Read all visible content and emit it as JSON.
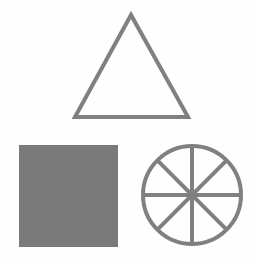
{
  "canvas": {
    "width": 256,
    "height": 265,
    "background": "#fefefe"
  },
  "colors": {
    "stroke": "#808080",
    "fill": "#7a7a7a"
  },
  "shapes": [
    {
      "type": "triangle",
      "points": [
        [
          131,
          15
        ],
        [
          75,
          117
        ],
        [
          188,
          117
        ]
      ],
      "fill": "none",
      "stroke_width": 4
    },
    {
      "type": "square",
      "x": 19,
      "y": 145,
      "width": 99,
      "height": 102,
      "fill": "#7a7a7a"
    },
    {
      "type": "wheel",
      "cx": 192,
      "cy": 195,
      "r": 50,
      "spokes": 8,
      "stroke_width": 4
    }
  ]
}
